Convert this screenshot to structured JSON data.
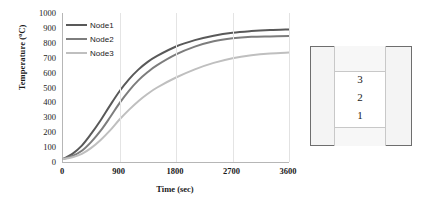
{
  "chart_data": {
    "type": "line",
    "title": "",
    "xlabel": "Time (sec)",
    "ylabel": "Temperature (°C)",
    "ylabel_text": "Temperature (",
    "ylabel_sup": "o",
    "ylabel_tail": "C)",
    "xlim": [
      0,
      3600
    ],
    "ylim": [
      0,
      1000
    ],
    "grid": "vertical",
    "legend_position": "top-left inside plot",
    "xticks": [
      0,
      900,
      1800,
      2700,
      3600
    ],
    "yticks": [
      0,
      100,
      200,
      300,
      400,
      500,
      600,
      700,
      800,
      900,
      1000
    ],
    "x": [
      0,
      150,
      300,
      450,
      600,
      750,
      900,
      1050,
      1200,
      1350,
      1500,
      1800,
      2100,
      2400,
      2700,
      3000,
      3300,
      3600
    ],
    "series": [
      {
        "name": "Node1",
        "color": "#595959",
        "values": [
          20,
          55,
          110,
          190,
          280,
          380,
          475,
          555,
          620,
          672,
          712,
          775,
          818,
          848,
          868,
          879,
          886,
          890
        ]
      },
      {
        "name": "Node2",
        "color": "#7d7d7d",
        "values": [
          20,
          40,
          75,
          135,
          210,
          300,
          395,
          478,
          548,
          604,
          650,
          722,
          774,
          810,
          830,
          840,
          843,
          845
        ]
      },
      {
        "name": "Node3",
        "color": "#bfbfbf",
        "values": [
          20,
          32,
          55,
          95,
          148,
          212,
          285,
          350,
          408,
          458,
          500,
          567,
          622,
          665,
          697,
          717,
          729,
          735
        ]
      }
    ]
  },
  "legend": {
    "items": [
      {
        "label": "Node1",
        "color": "#595959"
      },
      {
        "label": "Node2",
        "color": "#7d7d7d"
      },
      {
        "label": "Node3",
        "color": "#bfbfbf"
      }
    ]
  },
  "section_diagram": {
    "layers": [
      {
        "id": "3",
        "label": "3"
      },
      {
        "id": "2",
        "label": "2"
      },
      {
        "id": "1",
        "label": "1"
      }
    ]
  }
}
